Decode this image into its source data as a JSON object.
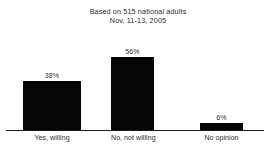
{
  "header": {
    "line1": "Based on 515 national adults",
    "line2": "Nov. 11-13, 2005"
  },
  "chart_data": {
    "type": "bar",
    "title": "Based on 515 national adults",
    "subtitle": "Nov. 11-13, 2005",
    "categories": [
      "Yes, willing",
      "No, not willing",
      "No opinion"
    ],
    "values": [
      38,
      56,
      6
    ],
    "data_labels": [
      "38%",
      "56%",
      "6%"
    ],
    "xlabel": "",
    "ylabel": "",
    "ylim": [
      0,
      70
    ],
    "grid": false,
    "legend": false,
    "bar_color": "#050505",
    "background_color": "#ffffff",
    "text_color": "#2b2b2b"
  }
}
